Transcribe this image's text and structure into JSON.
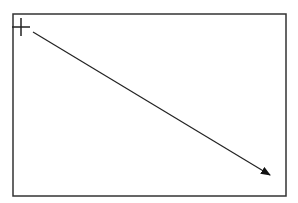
{
  "diagram": {
    "frame": {
      "x": 13,
      "y": 14,
      "width": 273,
      "height": 182,
      "stroke": "#333333",
      "stroke_width": 1.5
    },
    "crosshair": {
      "cx": 21,
      "cy": 27,
      "size": 9,
      "stroke": "#222222",
      "stroke_width": 1.5
    },
    "arrow": {
      "x1": 33,
      "y1": 32,
      "x2": 270,
      "y2": 175,
      "stroke": "#222222",
      "stroke_width": 1.2,
      "head_color": "#111111"
    }
  }
}
